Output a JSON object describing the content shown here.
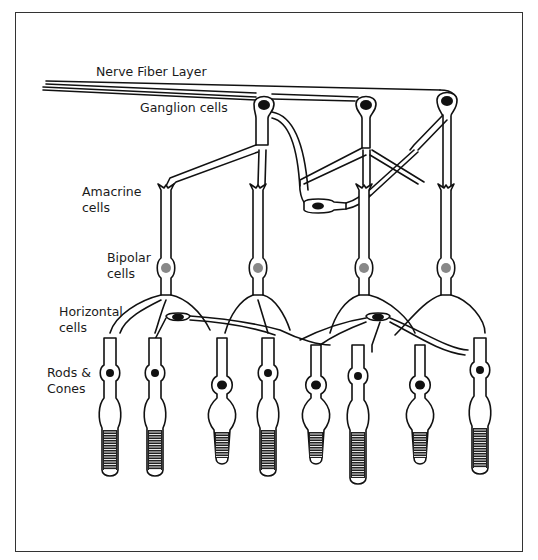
{
  "diagram": {
    "frame_color": "#333333",
    "ink_color": "#111111",
    "bipolar_nucleus_color": "#888888",
    "labels": {
      "nerve_fiber_layer": "Nerve Fiber Layer",
      "ganglion": "Ganglion cells",
      "amacrine_line1": "Amacrine",
      "amacrine_line2": "cells",
      "bipolar_line1": "Bipolar",
      "bipolar_line2": "cells",
      "horizontal_line1": "Horizontal",
      "horizontal_line2": "cells",
      "rods_line1": "Rods &",
      "rods_line2": "Cones"
    },
    "ganglion_cells": [
      {
        "x": 264,
        "y": 105
      },
      {
        "x": 366,
        "y": 105
      },
      {
        "x": 447,
        "y": 101
      }
    ],
    "amacrine_cell": {
      "x": 318,
      "y": 205
    },
    "bipolar_cells": [
      {
        "x": 166,
        "y": 268
      },
      {
        "x": 258,
        "y": 268
      },
      {
        "x": 364,
        "y": 268
      },
      {
        "x": 446,
        "y": 268
      }
    ],
    "horizontal_cells": [
      {
        "x": 178,
        "y": 319
      },
      {
        "x": 378,
        "y": 319
      }
    ],
    "photoreceptors": [
      {
        "type": "rod",
        "x": 110
      },
      {
        "type": "rod",
        "x": 155
      },
      {
        "type": "cone",
        "x": 222
      },
      {
        "type": "rod",
        "x": 268
      },
      {
        "type": "cone",
        "x": 316
      },
      {
        "type": "rod",
        "x": 358
      },
      {
        "type": "cone",
        "x": 420
      },
      {
        "type": "rod",
        "x": 480
      }
    ]
  }
}
